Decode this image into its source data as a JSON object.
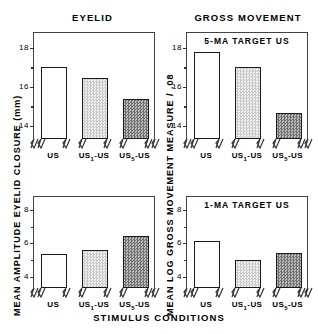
{
  "figure": {
    "xlabel": "STIMULUS CONDITIONS",
    "column_titles": [
      "EYELID",
      "GROSS MOVEMENT"
    ],
    "ylabel_left": "MEAN AMPLITUDE EYELID CLOSURE (mm)",
    "ylabel_right": "MEAN LOG GROSS MOVEMENT MEASURE / .08",
    "categories_plain": [
      "US",
      "US1-US",
      "US5-US"
    ]
  },
  "chart_data": [
    {
      "type": "bar",
      "panel": "top-left",
      "title": "EYELID",
      "annotation": "5-MA TARGET US",
      "categories": [
        "US",
        "US₁-US",
        "US₅-US"
      ],
      "values": [
        17.0,
        16.45,
        15.35
      ],
      "ylabel": "MEAN AMPLITUDE EYELID CLOSURE (mm)",
      "xlabel": "STIMULUS CONDITIONS",
      "ylim": [
        13.3,
        18.8
      ],
      "yticks": [
        14,
        16,
        18
      ],
      "ytick_labels": [
        "14",
        "16",
        "18"
      ],
      "yticks_minor": [
        15,
        17,
        18
      ],
      "grid": false,
      "axis_break": true,
      "bar_fills": [
        "open",
        "light-stipple",
        "dark-stipple"
      ]
    },
    {
      "type": "bar",
      "panel": "top-right",
      "title": "GROSS MOVEMENT",
      "annotation": "5-MA TARGET US",
      "categories": [
        "US",
        "US₁-US",
        "US₅-US"
      ],
      "values": [
        17.75,
        17.0,
        14.65
      ],
      "ylabel": "MEAN LOG GROSS MOVEMENT MEASURE / .08",
      "xlabel": "STIMULUS CONDITIONS",
      "ylim": [
        13.3,
        18.8
      ],
      "yticks": [
        14,
        16,
        18
      ],
      "ytick_labels": [
        "14",
        "16",
        "18"
      ],
      "yticks_minor": [
        15,
        17,
        18
      ],
      "grid": false,
      "axis_break": true,
      "bar_fills": [
        "open",
        "light-stipple",
        "dark-stipple"
      ]
    },
    {
      "type": "bar",
      "panel": "bottom-left",
      "title": "EYELID",
      "annotation": "1-MA TARGET US",
      "categories": [
        "US",
        "US₁-US",
        "US₅-US"
      ],
      "values": [
        5.35,
        5.55,
        6.4
      ],
      "ylabel": "MEAN AMPLITUDE EYELID CLOSURE (mm)",
      "xlabel": "STIMULUS CONDITIONS",
      "ylim": [
        3.3,
        8.8
      ],
      "yticks": [
        4,
        6,
        8
      ],
      "ytick_labels": [
        "4",
        "6",
        "8"
      ],
      "yticks_minor": [
        5,
        7,
        8
      ],
      "grid": false,
      "axis_break": true,
      "bar_fills": [
        "open",
        "light-stipple",
        "dark-stipple"
      ]
    },
    {
      "type": "bar",
      "panel": "bottom-right",
      "title": "GROSS MOVEMENT",
      "annotation": "1-MA TARGET US",
      "categories": [
        "US",
        "US₁-US",
        "US₅-US"
      ],
      "values": [
        6.1,
        5.0,
        5.4
      ],
      "ylabel": "MEAN LOG GROSS MOVEMENT MEASURE / .08",
      "xlabel": "STIMULUS CONDITIONS",
      "ylim": [
        3.3,
        8.8
      ],
      "yticks": [
        4,
        6,
        8
      ],
      "ytick_labels": [
        "4",
        "6",
        "8"
      ],
      "yticks_minor": [
        5,
        7,
        8
      ],
      "grid": false,
      "axis_break": true,
      "bar_fills": [
        "open",
        "light-stipple",
        "dark-stipple"
      ]
    }
  ]
}
